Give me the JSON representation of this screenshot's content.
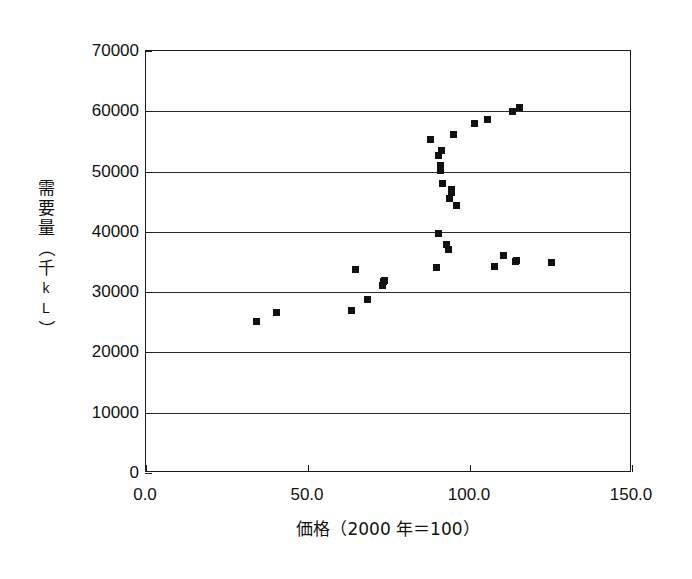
{
  "chart_data": {
    "type": "scatter",
    "title": "",
    "xlabel": "価格（2000 年＝100）",
    "ylabel": "需要量（千kL）",
    "ylabel_chars": [
      "需",
      "要",
      "量",
      "（",
      "千",
      "k",
      "L",
      "）"
    ],
    "xlim": [
      0.0,
      150.0
    ],
    "ylim": [
      0,
      70000
    ],
    "xticks": [
      "0.0",
      "50.0",
      "100.0",
      "150.0"
    ],
    "xtick_values": [
      0.0,
      50.0,
      100.0,
      150.0
    ],
    "yticks": [
      "0",
      "10000",
      "20000",
      "30000",
      "40000",
      "50000",
      "60000",
      "70000"
    ],
    "ytick_values": [
      0,
      10000,
      20000,
      30000,
      40000,
      50000,
      60000,
      70000
    ],
    "grid": "horizontal",
    "legend": "none",
    "marker": "square",
    "marker_color": "#111111",
    "points": [
      {
        "x": 34.0,
        "y": 25100
      },
      {
        "x": 40.3,
        "y": 26700
      },
      {
        "x": 63.3,
        "y": 26900
      },
      {
        "x": 64.8,
        "y": 33800
      },
      {
        "x": 68.3,
        "y": 28700
      },
      {
        "x": 72.9,
        "y": 31100
      },
      {
        "x": 73.2,
        "y": 31700
      },
      {
        "x": 73.5,
        "y": 31900
      },
      {
        "x": 87.8,
        "y": 55300
      },
      {
        "x": 89.6,
        "y": 34100
      },
      {
        "x": 90.2,
        "y": 39700
      },
      {
        "x": 90.4,
        "y": 52600
      },
      {
        "x": 90.8,
        "y": 51000
      },
      {
        "x": 91.0,
        "y": 50200
      },
      {
        "x": 91.2,
        "y": 53500
      },
      {
        "x": 91.6,
        "y": 48000
      },
      {
        "x": 92.7,
        "y": 37900
      },
      {
        "x": 93.4,
        "y": 37100
      },
      {
        "x": 93.6,
        "y": 45500
      },
      {
        "x": 94.2,
        "y": 47100
      },
      {
        "x": 94.4,
        "y": 46500
      },
      {
        "x": 95.0,
        "y": 56200
      },
      {
        "x": 95.8,
        "y": 44400
      },
      {
        "x": 101.5,
        "y": 58000
      },
      {
        "x": 105.3,
        "y": 58700
      },
      {
        "x": 107.7,
        "y": 34300
      },
      {
        "x": 110.3,
        "y": 36100
      },
      {
        "x": 113.2,
        "y": 60000
      },
      {
        "x": 114.0,
        "y": 35100
      },
      {
        "x": 114.3,
        "y": 35300
      },
      {
        "x": 115.4,
        "y": 60700
      },
      {
        "x": 125.0,
        "y": 35000
      }
    ]
  }
}
